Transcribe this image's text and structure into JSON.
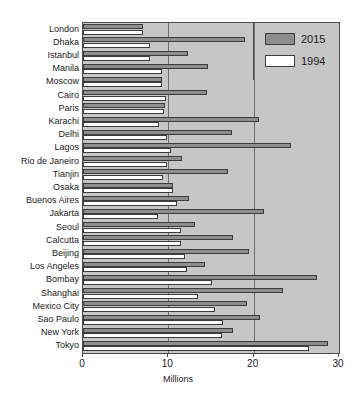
{
  "clipped_header_text": "",
  "chart_data": {
    "type": "bar",
    "orientation": "horizontal",
    "title": "",
    "xlabel": "Millions",
    "ylabel": "",
    "xlim": [
      0,
      30
    ],
    "xticks": [
      0,
      10,
      20,
      30
    ],
    "xtick_labels": [
      "0",
      "10",
      "20",
      "30"
    ],
    "grid": true,
    "grid_axis": "x",
    "legend_position": "top-right",
    "plot_background_color": "#c6c6c6",
    "categories": [
      "London",
      "Dhaka",
      "Istanbul",
      "Manila",
      "Moscow",
      "Cairo",
      "Paris",
      "Karachi",
      "Delhi",
      "Lagos",
      "Rio de Janeiro",
      "Tianjin",
      "Osaka",
      "Buenos Aires",
      "Jakarta",
      "Seoul",
      "Calcutta",
      "Beijing",
      "Los Angeles",
      "Bombay",
      "Shanghai",
      "Mexico City",
      "Sao Paulo",
      "New York",
      "Tokyo"
    ],
    "series": [
      {
        "name": "2015",
        "color": "#8e8e8e",
        "values": [
          7.0,
          19.0,
          12.3,
          14.7,
          9.3,
          14.5,
          9.6,
          20.6,
          17.5,
          24.4,
          11.6,
          17.0,
          10.6,
          12.4,
          21.2,
          13.1,
          17.6,
          19.4,
          14.3,
          27.4,
          23.4,
          19.2,
          20.8,
          17.6,
          28.7
        ]
      },
      {
        "name": "1994",
        "color": "#ffffff",
        "values": [
          7.0,
          7.8,
          7.8,
          9.3,
          9.2,
          9.7,
          9.5,
          8.9,
          9.9,
          10.3,
          9.8,
          9.4,
          10.6,
          11.0,
          8.8,
          11.5,
          11.5,
          12.0,
          12.2,
          15.1,
          13.5,
          15.5,
          16.4,
          16.3,
          26.5
        ]
      }
    ]
  },
  "legend": {
    "entries": [
      {
        "label": "2015",
        "swatch": "gray"
      },
      {
        "label": "1994",
        "swatch": "white"
      }
    ]
  },
  "axis": {
    "x_title": "Millions"
  }
}
